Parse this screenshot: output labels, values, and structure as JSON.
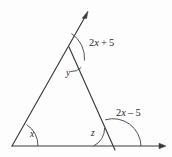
{
  "figure": {
    "type": "geometry-diagram",
    "background_color": "#fdfdfd",
    "line_color": "#3a3a3a",
    "labels": {
      "top_exterior_angle": "2x + 5",
      "top_exterior_coefficient": "2",
      "top_exterior_variable": "x",
      "top_exterior_operator": "+",
      "top_exterior_constant": "5",
      "right_exterior_angle": "2x – 5",
      "right_exterior_coefficient": "2",
      "right_exterior_variable": "x",
      "right_exterior_operator": "–",
      "right_exterior_constant": "5",
      "apex_interior_angle": "y",
      "left_interior_angle": "x",
      "right_interior_angle": "z"
    },
    "vertices": {
      "left": [
        12,
        146
      ],
      "apex": [
        76,
        62
      ],
      "bottom_right": [
        113,
        146
      ],
      "ray_top_tip": [
        88,
        12
      ],
      "baseline_right_tip": [
        166,
        146
      ]
    },
    "arrows": [
      "ray-top-arrow",
      "baseline-right-arrow"
    ]
  }
}
